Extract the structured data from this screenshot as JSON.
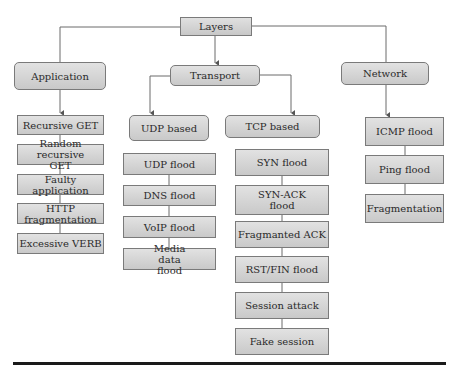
{
  "diagram": {
    "root": "Layers",
    "layers": [
      {
        "label": "Application",
        "attacks": [
          "Recursive GET",
          "Random recursive GET",
          "Faulty application",
          "HTTP fragmentation",
          "Excessive VERB"
        ]
      },
      {
        "label": "Transport",
        "groups": [
          {
            "label": "UDP based",
            "attacks": [
              "UDP flood",
              "DNS flood",
              "VoIP flood",
              "Media data flood"
            ]
          },
          {
            "label": "TCP based",
            "attacks": [
              "SYN flood",
              "SYN-ACK flood",
              "Fragmanted ACK",
              "RST/FIN flood",
              "Session attack",
              "Fake session"
            ]
          }
        ]
      },
      {
        "label": "Network",
        "attacks": [
          "ICMP flood",
          "Ping flood",
          "Fragmentation"
        ]
      }
    ]
  },
  "colors": {
    "box_fill": "#d4d4d4",
    "box_border": "#7a7a7a",
    "line": "#6a6a6a",
    "rule": "#1a1a1a"
  }
}
